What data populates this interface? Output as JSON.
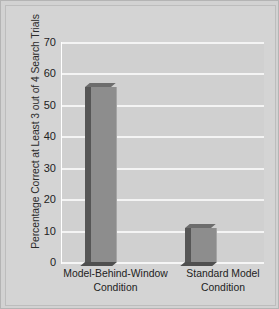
{
  "chart_data": {
    "type": "bar",
    "title": "",
    "xlabel": "",
    "ylabel": "Percentage Correct at Least 3 out of 4 Search Trials",
    "categories": [
      "Model-Behind-Window Condition",
      "Standard Model Condition"
    ],
    "category_lines": [
      [
        "Model-Behind-Window",
        "Condition"
      ],
      [
        "Standard Model",
        "Condition"
      ]
    ],
    "values": [
      57,
      12
    ],
    "ylim": [
      0,
      70
    ],
    "yticks": [
      0,
      10,
      20,
      30,
      40,
      50,
      60,
      70
    ],
    "ytick_labels": [
      "0",
      "10",
      "20",
      "30",
      "40",
      "50",
      "60",
      "70"
    ],
    "grid": true,
    "legend": "none",
    "colors": {
      "bar_face": "#8d8d8d",
      "bar_side": "#565656",
      "bar_top": "#6d6d6d",
      "plot_background": "#d0d0d0",
      "figure_background": "#d4d4d4",
      "gridline": "#f4f4f4",
      "text": "#222222"
    }
  }
}
